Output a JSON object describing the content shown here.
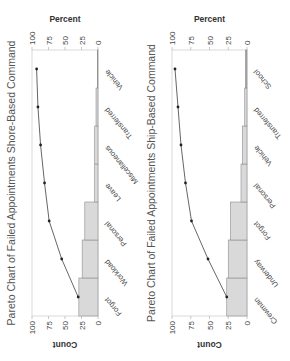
{
  "chart_data": [
    {
      "type": "bar",
      "subtype": "pareto",
      "title": "Pareto Chart of Failed Appointments Shore-Based Command",
      "xlabel": "",
      "ylabel": "Count",
      "y2label": "Percent",
      "ylim": [
        0,
        100
      ],
      "y2lim": [
        0,
        100
      ],
      "yticks": [
        "0",
        "25",
        "50",
        "75",
        "100"
      ],
      "y2ticks": [
        "0",
        "25",
        "50",
        "75",
        "100"
      ],
      "categories": [
        "Forgot",
        "Workload",
        "Personal",
        "Leave",
        "Miscellaneous",
        "Transferred",
        "Vehicle"
      ],
      "series": [
        {
          "name": "Count",
          "type": "bar",
          "values": [
            29,
            24,
            20,
            5,
            5,
            3,
            1
          ]
        },
        {
          "name": "Cumulative Percent",
          "type": "line",
          "values": [
            30,
            55,
            74,
            81,
            87,
            91,
            93
          ]
        }
      ],
      "grid": false,
      "bar_color": "#d9d9d9",
      "last_bar_color": "#7a7a7a",
      "line_color": "#555555"
    },
    {
      "type": "bar",
      "subtype": "pareto",
      "title": "Pareto Chart of Failed Appointments Ship-Based Command",
      "xlabel": "",
      "ylabel": "Count",
      "y2label": "Percent",
      "ylim": [
        0,
        100
      ],
      "y2lim": [
        0,
        100
      ],
      "yticks": [
        "0",
        "25",
        "50",
        "75",
        "100"
      ],
      "y2ticks": [
        "0",
        "25",
        "50",
        "75",
        "100"
      ],
      "categories": [
        "Crewman",
        "Underway",
        "Forgot",
        "Personal",
        "Vehicle",
        "Transferred",
        "School"
      ],
      "series": [
        {
          "name": "Count",
          "type": "bar",
          "values": [
            27,
            25,
            22,
            8,
            6,
            3,
            2
          ]
        },
        {
          "name": "Cumulative Percent",
          "type": "line",
          "values": [
            27,
            52,
            74,
            82,
            88,
            92,
            96
          ]
        }
      ],
      "grid": false,
      "bar_color": "#d9d9d9",
      "last_bar_color": "#a6a6a6",
      "line_color": "#555555"
    }
  ]
}
